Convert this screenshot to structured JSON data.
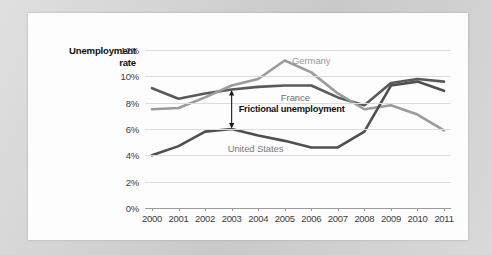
{
  "chart_data": {
    "type": "line",
    "title": "",
    "ylabel_lines": [
      "Unemployment",
      "rate"
    ],
    "xlabel": "",
    "x": [
      2000,
      2001,
      2002,
      2003,
      2004,
      2005,
      2006,
      2007,
      2008,
      2009,
      2010,
      2011
    ],
    "xtick_labels": [
      "2000",
      "2001",
      "2002",
      "2003",
      "2004",
      "2005",
      "2006",
      "2007",
      "2008",
      "2009",
      "2010",
      "2011"
    ],
    "ytick_labels": [
      "0%",
      "2%",
      "4%",
      "6%",
      "8%",
      "10%",
      "12%"
    ],
    "ytick_values": [
      0,
      2,
      4,
      6,
      8,
      10,
      12
    ],
    "ylim": [
      0,
      12
    ],
    "grid": true,
    "legend_position": "inline-labels",
    "series": [
      {
        "name": "France",
        "color": "#5a5a5a",
        "values": [
          9.1,
          8.3,
          8.7,
          9.0,
          9.2,
          9.3,
          9.3,
          8.4,
          7.8,
          9.5,
          9.8,
          9.6
        ],
        "label": "France",
        "label_color": "#6f6f6f"
      },
      {
        "name": "Germany",
        "color": "#9b9b9b",
        "values": [
          7.5,
          7.6,
          8.4,
          9.3,
          9.8,
          11.2,
          10.3,
          8.7,
          7.5,
          7.8,
          7.1,
          5.9
        ],
        "label": "Germany",
        "label_color": "#9b9b9b"
      },
      {
        "name": "United States",
        "color": "#4f4f4f",
        "values": [
          4.0,
          4.7,
          5.8,
          6.0,
          5.5,
          5.1,
          4.6,
          4.6,
          5.8,
          9.3,
          9.6,
          8.9
        ],
        "label": "United States",
        "label_color": "#7a7a7a"
      }
    ],
    "annotations": [
      {
        "text": "Frictional unemployment",
        "arrow": "double-headed-vertical",
        "at_x": 2003,
        "from_y": 6.0,
        "to_y": 9.0,
        "color": "#1a1a1a"
      }
    ]
  },
  "colors": {
    "page_background": "#d2d2d2",
    "card_background": "#fdfdfd",
    "gridline": "#dcdcdc",
    "axis": "#9a9a9a",
    "text": "#3c3c3c"
  }
}
